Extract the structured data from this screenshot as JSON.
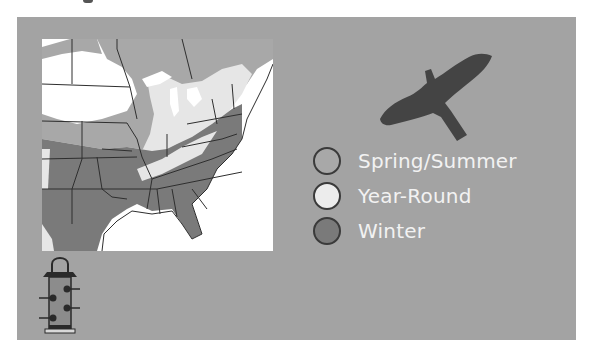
{
  "legend": {
    "items": [
      {
        "label": "Spring/Summer",
        "color": "#a8a8a8"
      },
      {
        "label": "Year-Round",
        "color": "#ececec"
      },
      {
        "label": "Winter",
        "color": "#7a7a7a"
      }
    ]
  },
  "colors": {
    "panel": "#a3a3a3",
    "map_background": "#ffffff",
    "winter_fill": "#7a7a7a",
    "summer_fill": "#a8a8a8",
    "year_round_fill": "#e6e6e6",
    "border_lines": "#2e2e2e",
    "bird_silhouette": "#444444"
  },
  "icons": {
    "bird": "hawk-silhouette-icon",
    "feeder": "tube-bird-feeder-icon"
  }
}
